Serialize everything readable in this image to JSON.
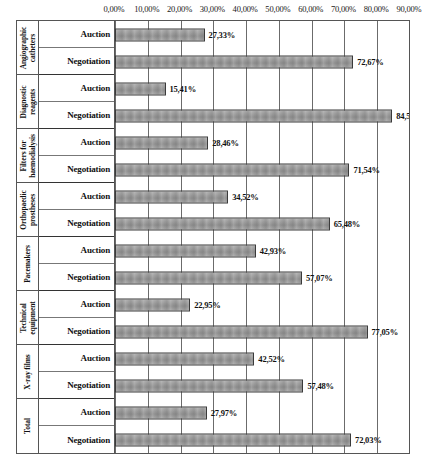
{
  "chart_data": {
    "type": "bar",
    "orientation": "horizontal",
    "title": "",
    "xlabel": "",
    "ylabel": "",
    "xlim": [
      0,
      90
    ],
    "grid": true,
    "legend": "none",
    "decimal_separator": ",",
    "unit": "%",
    "x_ticks": [
      "0,00%",
      "10,00%",
      "20,00%",
      "30,00%",
      "40,00%",
      "50,00%",
      "60,00%",
      "70,00%",
      "80,00%",
      "90,00%"
    ],
    "x_tick_values": [
      0,
      10,
      20,
      30,
      40,
      50,
      60,
      70,
      80,
      90
    ],
    "series_names": [
      "Auction",
      "Negotiation"
    ],
    "categories": [
      "Angiographic catheters",
      "Diagnostic reagents",
      "Filters for haemodialysis",
      "Orthopaedic prostheses",
      "Pacemakers",
      "Technical equipment",
      "X-ray films",
      "Total"
    ],
    "series": [
      {
        "name": "Auction",
        "values": [
          27.33,
          15.41,
          28.46,
          34.52,
          42.93,
          22.95,
          42.52,
          27.97
        ]
      },
      {
        "name": "Negotiation",
        "values": [
          72.67,
          84.59,
          71.54,
          65.48,
          57.07,
          77.05,
          57.48,
          72.03
        ]
      }
    ],
    "groups": [
      {
        "category_lines": [
          "Angiographic",
          "catheters"
        ],
        "rows": [
          {
            "label": "Auction",
            "value": 27.33,
            "value_label": "27,33%"
          },
          {
            "label": "Negotiation",
            "value": 72.67,
            "value_label": "72,67%"
          }
        ]
      },
      {
        "category_lines": [
          "Diagnostic",
          "reagents"
        ],
        "rows": [
          {
            "label": "Auction",
            "value": 15.41,
            "value_label": "15,41%"
          },
          {
            "label": "Negotiation",
            "value": 84.59,
            "value_label": "84,59%"
          }
        ]
      },
      {
        "category_lines": [
          "Filters for",
          "haemodialysis"
        ],
        "rows": [
          {
            "label": "Auction",
            "value": 28.46,
            "value_label": "28,46%"
          },
          {
            "label": "Negotiation",
            "value": 71.54,
            "value_label": "71,54%"
          }
        ]
      },
      {
        "category_lines": [
          "Orthopaedic",
          "prostheses"
        ],
        "rows": [
          {
            "label": "Auction",
            "value": 34.52,
            "value_label": "34,52%"
          },
          {
            "label": "Negotiation",
            "value": 65.48,
            "value_label": "65,48%"
          }
        ]
      },
      {
        "category_lines": [
          "Pacemakers"
        ],
        "rows": [
          {
            "label": "Auction",
            "value": 42.93,
            "value_label": "42,93%"
          },
          {
            "label": "Negotiation",
            "value": 57.07,
            "value_label": "57,07%"
          }
        ]
      },
      {
        "category_lines": [
          "Technical",
          "equipment"
        ],
        "rows": [
          {
            "label": "Auction",
            "value": 22.95,
            "value_label": "22,95%"
          },
          {
            "label": "Negotiation",
            "value": 77.05,
            "value_label": "77,05%"
          }
        ]
      },
      {
        "category_lines": [
          "X-ray films"
        ],
        "rows": [
          {
            "label": "Auction",
            "value": 42.52,
            "value_label": "42,52%"
          },
          {
            "label": "Negotiation",
            "value": 57.48,
            "value_label": "57,48%"
          }
        ]
      },
      {
        "category_lines": [
          "Total"
        ],
        "rows": [
          {
            "label": "Auction",
            "value": 27.97,
            "value_label": "27,97%"
          },
          {
            "label": "Negotiation",
            "value": 72.03,
            "value_label": "72,03%"
          }
        ]
      }
    ]
  },
  "colors": {
    "bar_fill": "#9a9a9a",
    "bar_border": "#3a3a3a",
    "gridline": "#6b6b6b",
    "frame": "#555555",
    "text": "#111111",
    "background": "#ffffff"
  }
}
